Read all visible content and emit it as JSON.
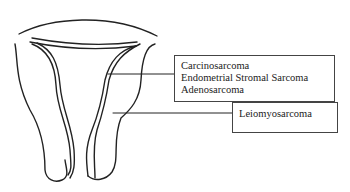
{
  "diagram": {
    "labels": {
      "inner_group": [
        "Carcinosarcoma",
        "Endometrial Stromal Sarcoma",
        "Adenosarcoma"
      ],
      "outer": "Leiomyosarcoma"
    }
  }
}
